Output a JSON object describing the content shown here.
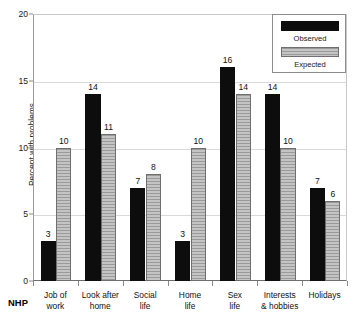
{
  "chart_data": {
    "type": "bar",
    "title": "",
    "xlabel": "NHP",
    "ylabel": "Percent with problems",
    "ylim": [
      0,
      20
    ],
    "yticks": [
      0,
      5,
      10,
      15,
      20
    ],
    "ytick_labels": [
      "0",
      "5",
      "10",
      "15",
      "20"
    ],
    "grid": true,
    "legend_position": "top-right",
    "categories": [
      "Job of work",
      "Look after home",
      "Social life",
      "Home life",
      "Sex life",
      "Interests & hobbies",
      "Holidays"
    ],
    "category_lines": [
      [
        "Job of",
        "work"
      ],
      [
        "Look after",
        "home"
      ],
      [
        "Social",
        "life"
      ],
      [
        "Home",
        "life"
      ],
      [
        "Sex",
        "life"
      ],
      [
        "Interests",
        "& hobbies"
      ],
      [
        "Holidays",
        ""
      ]
    ],
    "series": [
      {
        "name": "Observed",
        "color": "#0d0d0d",
        "values": [
          3,
          14,
          7,
          3,
          16,
          14,
          7
        ]
      },
      {
        "name": "Expected",
        "color": "#a8a8a8",
        "values": [
          10,
          11,
          8,
          10,
          14,
          10,
          6
        ]
      }
    ]
  },
  "legend": {
    "items": [
      {
        "label": "Observed",
        "swatch": "black-solid-swatch"
      },
      {
        "label": "Expected",
        "swatch": "gray-striped-swatch"
      }
    ]
  },
  "axes": {
    "y_title": "Percent with problems",
    "x_axis_name": "NHP"
  }
}
